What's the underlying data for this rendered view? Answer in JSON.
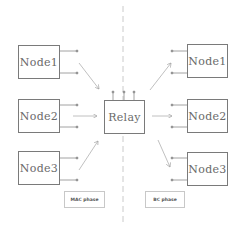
{
  "diagram": {
    "left_nodes": [
      {
        "label": "Node1"
      },
      {
        "label": "Node2"
      },
      {
        "label": "Node3"
      }
    ],
    "relay": {
      "label": "Relay"
    },
    "right_nodes": [
      {
        "label": "Node1"
      },
      {
        "label": "Node2"
      },
      {
        "label": "Node3"
      }
    ],
    "phases": {
      "left": "MAC phase",
      "right": "BC phase"
    },
    "colors": {
      "box_border": "#7a7a7a",
      "arrow": "#b0b0b0",
      "divider": "#bdbdbd",
      "text": "#6a6a6a"
    }
  }
}
